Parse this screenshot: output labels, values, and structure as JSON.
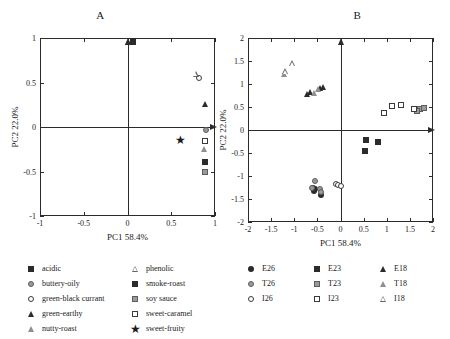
{
  "figure": {
    "panels": [
      {
        "id": "A",
        "title": "A",
        "xlabel": "PC1 58.4%",
        "ylabel": "PC2 22.0%",
        "xticks": [
          "-1",
          "-0.5",
          "0",
          "0.5",
          "1"
        ],
        "yticks": [
          "-1",
          "-0.5",
          "0",
          "0.5",
          "1"
        ]
      },
      {
        "id": "B",
        "title": "B",
        "xlabel": "PC1 58.4%",
        "ylabel": "PC2 22.0%",
        "xticks": [
          "-2",
          "-1.5",
          "-1",
          "-0.5",
          "0",
          "0.5",
          "1",
          "1.5",
          "2"
        ],
        "yticks": [
          "-2",
          "-1.5",
          "-1",
          "-0.5",
          "0",
          "0.5",
          "1",
          "1.5",
          "2"
        ]
      }
    ]
  },
  "legend_a": {
    "rows": [
      [
        {
          "marker": "square-filled",
          "label": "acidic"
        },
        {
          "marker": "triangle-open",
          "label": "phenolic"
        }
      ],
      [
        {
          "marker": "circle-grey",
          "label": "buttery-oily"
        },
        {
          "marker": "square-filled",
          "label": "smoke-roast"
        }
      ],
      [
        {
          "marker": "circle-open",
          "label": "green-black currant"
        },
        {
          "marker": "square-grey",
          "label": "soy sauce"
        }
      ],
      [
        {
          "marker": "triangle-filled",
          "label": "green-earthy"
        },
        {
          "marker": "square-open",
          "label": "sweet-caramel"
        }
      ],
      [
        {
          "marker": "triangle-grey",
          "label": "nutty-roast"
        },
        {
          "marker": "star",
          "label": "sweet-fruity"
        }
      ]
    ]
  },
  "legend_b": {
    "rows": [
      [
        {
          "marker": "circle-filled",
          "label": "E26"
        },
        {
          "marker": "square-filled",
          "label": "E23"
        },
        {
          "marker": "triangle-filled",
          "label": "E18"
        }
      ],
      [
        {
          "marker": "circle-grey",
          "label": "T26"
        },
        {
          "marker": "square-grey",
          "label": "T23"
        },
        {
          "marker": "triangle-grey",
          "label": "T18"
        }
      ],
      [
        {
          "marker": "circle-open",
          "label": "I26"
        },
        {
          "marker": "square-open",
          "label": "I23"
        },
        {
          "marker": "triangle-open",
          "label": "I18"
        }
      ]
    ]
  },
  "chart_data": [
    {
      "type": "scatter",
      "panel": "A",
      "title": "A",
      "xlabel": "PC1 58.4%",
      "ylabel": "PC2 22.0%",
      "xlim": [
        -1,
        1
      ],
      "ylim": [
        -1,
        1
      ],
      "xticks": [
        -1,
        -0.5,
        0,
        0.5,
        1
      ],
      "yticks": [
        -1,
        -0.5,
        0,
        0.5,
        1
      ],
      "grid": false,
      "legend_position": "below",
      "series": [
        {
          "name": "acidic",
          "marker": "square-filled",
          "points": [
            [
              0.88,
              -0.39
            ]
          ]
        },
        {
          "name": "buttery-oily",
          "marker": "circle-grey",
          "points": [
            [
              0.9,
              -0.03
            ]
          ]
        },
        {
          "name": "green-black currant",
          "marker": "circle-open",
          "points": [
            [
              0.82,
              0.55
            ]
          ]
        },
        {
          "name": "green-earthy",
          "marker": "triangle-filled",
          "points": [
            [
              0.01,
              0.95
            ],
            [
              0.88,
              0.26
            ]
          ]
        },
        {
          "name": "nutty-roast",
          "marker": "triangle-grey",
          "points": [
            [
              0.87,
              -0.25
            ]
          ]
        },
        {
          "name": "phenolic",
          "marker": "triangle-open",
          "points": [
            [
              0.78,
              0.6
            ]
          ]
        },
        {
          "name": "smoke-roast",
          "marker": "square-filled",
          "points": [
            [
              0.06,
              0.95
            ]
          ]
        },
        {
          "name": "soy sauce",
          "marker": "square-grey",
          "points": [
            [
              0.88,
              -0.5
            ]
          ]
        },
        {
          "name": "sweet-caramel",
          "marker": "square-open",
          "points": [
            [
              0.88,
              -0.16
            ]
          ]
        },
        {
          "name": "sweet-fruity",
          "marker": "star",
          "points": [
            [
              0.6,
              -0.15
            ]
          ]
        }
      ]
    },
    {
      "type": "scatter",
      "panel": "B",
      "title": "B",
      "xlabel": "PC1 58.4%",
      "ylabel": "PC2 22.0%",
      "xlim": [
        -2,
        2
      ],
      "ylim": [
        -2,
        2
      ],
      "xticks": [
        -2,
        -1.5,
        -1,
        -0.5,
        0,
        0.5,
        1,
        1.5,
        2
      ],
      "yticks": [
        -2,
        -1.5,
        -1,
        -0.5,
        0,
        0.5,
        1,
        1.5,
        2
      ],
      "grid": false,
      "legend_position": "below",
      "series": [
        {
          "name": "E26",
          "marker": "circle-filled",
          "points": [
            [
              -0.6,
              -1.25
            ],
            [
              -0.57,
              -1.32
            ],
            [
              -0.55,
              -1.28
            ],
            [
              -0.42,
              -1.42
            ]
          ]
        },
        {
          "name": "E23",
          "marker": "square-filled",
          "points": [
            [
              0.55,
              -0.22
            ],
            [
              0.82,
              -0.25
            ],
            [
              0.52,
              -0.45
            ]
          ]
        },
        {
          "name": "E18",
          "marker": "triangle-filled",
          "points": [
            [
              -0.72,
              0.78
            ],
            [
              -0.66,
              0.82
            ],
            [
              -0.45,
              0.92
            ],
            [
              -0.38,
              0.93
            ]
          ]
        },
        {
          "name": "T26",
          "marker": "circle-grey",
          "points": [
            [
              -0.55,
              -1.1
            ],
            [
              -0.62,
              -1.27
            ],
            [
              -0.45,
              -1.28
            ],
            [
              -0.43,
              -1.35
            ]
          ]
        },
        {
          "name": "T23",
          "marker": "square-grey",
          "points": [
            [
              1.72,
              0.45
            ],
            [
              1.8,
              0.47
            ],
            [
              1.66,
              0.42
            ]
          ]
        },
        {
          "name": "T18",
          "marker": "triangle-grey",
          "points": [
            [
              -1.22,
              1.22
            ],
            [
              -0.58,
              0.8
            ],
            [
              -0.48,
              0.9
            ]
          ]
        },
        {
          "name": "I26",
          "marker": "circle-open",
          "points": [
            [
              -0.1,
              -1.18
            ],
            [
              -0.05,
              -1.2
            ],
            [
              0.02,
              -1.22
            ]
          ]
        },
        {
          "name": "I23",
          "marker": "square-open",
          "points": [
            [
              0.95,
              0.38
            ],
            [
              1.12,
              0.52
            ],
            [
              1.3,
              0.54
            ],
            [
              1.58,
              0.45
            ]
          ]
        },
        {
          "name": "I18",
          "marker": "triangle-open",
          "points": [
            [
              -1.2,
              1.28
            ],
            [
              -1.05,
              1.45
            ]
          ]
        }
      ]
    }
  ]
}
